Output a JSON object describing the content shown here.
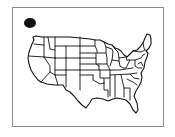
{
  "map": {
    "title": "United States map",
    "region": "Contiguous United States",
    "style": "state outlines, black on white",
    "frame_color": "#8a8a8a",
    "line_color": "#111111",
    "background": "#ffffff"
  },
  "marker": {
    "shape": "filled circle",
    "color": "#111111",
    "position": "top-left of frame"
  }
}
